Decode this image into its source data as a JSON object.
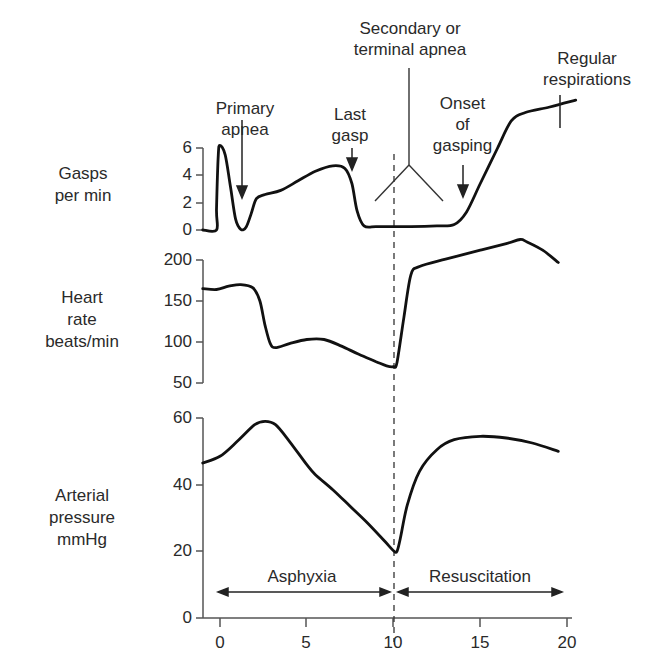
{
  "chart_data": [
    {
      "type": "line",
      "panel": "gasps",
      "ylabel": "Gasps per min",
      "ylabel_lines": [
        "Gasps",
        "per min"
      ],
      "yticks": [
        0,
        2,
        4,
        6
      ],
      "ylim": [
        0,
        6
      ],
      "xlim": [
        -1,
        21
      ],
      "series": [
        {
          "name": "Gasps per min",
          "points": [
            [
              -1,
              0
            ],
            [
              -0.2,
              0
            ],
            [
              -0.2,
              1.5
            ],
            [
              -0.1,
              5.5
            ],
            [
              0,
              6.2
            ],
            [
              0.3,
              5.5
            ],
            [
              0.6,
              3.2
            ],
            [
              0.9,
              0.8
            ],
            [
              1.2,
              0.05
            ],
            [
              1.5,
              0.2
            ],
            [
              1.8,
              1.2
            ],
            [
              2.1,
              2.3
            ],
            [
              2.6,
              2.6
            ],
            [
              3.5,
              2.9
            ],
            [
              4.5,
              3.6
            ],
            [
              5.5,
              4.3
            ],
            [
              6.5,
              4.7
            ],
            [
              7.2,
              4.5
            ],
            [
              7.6,
              3.4
            ],
            [
              7.9,
              1.4
            ],
            [
              8.3,
              0.3
            ],
            [
              9,
              0.25
            ],
            [
              10,
              0.25
            ],
            [
              11,
              0.25
            ],
            [
              12.5,
              0.3
            ],
            [
              13.5,
              0.4
            ],
            [
              14.2,
              1.3
            ],
            [
              15,
              3.4
            ],
            [
              16,
              6.0
            ],
            [
              16.8,
              8.0
            ],
            [
              17.6,
              8.6
            ],
            [
              19,
              9.0
            ],
            [
              20.5,
              9.5
            ]
          ]
        }
      ],
      "annotations": [
        {
          "text": "Primary apnea",
          "x": 1.2,
          "arrow_to_y": 2.2
        },
        {
          "text": "Last gasp",
          "x": 7.7,
          "arrow_to_y": 6.1
        },
        {
          "text": "Secondary or terminal apnea",
          "x": 11
        },
        {
          "text": "Onset of gasping",
          "x": 14.0,
          "arrow_to_y": 1.8
        },
        {
          "text": "Regular respirations",
          "x": 19.0
        }
      ]
    },
    {
      "type": "line",
      "panel": "heart_rate",
      "ylabel": "Heart rate beats/min",
      "ylabel_lines": [
        "Heart",
        "rate",
        "beats/min"
      ],
      "yticks": [
        50,
        100,
        150,
        200
      ],
      "ylim": [
        50,
        200
      ],
      "xlim": [
        -1,
        21
      ],
      "series": [
        {
          "name": "Heart rate",
          "points": [
            [
              -1,
              165
            ],
            [
              -0.2,
              164
            ],
            [
              0.5,
              168
            ],
            [
              1.2,
              170
            ],
            [
              1.9,
              166
            ],
            [
              2.3,
              150
            ],
            [
              2.6,
              120
            ],
            [
              2.9,
              98
            ],
            [
              3.2,
              93
            ],
            [
              4.0,
              98
            ],
            [
              5.0,
              103
            ],
            [
              6.0,
              103
            ],
            [
              7.0,
              95
            ],
            [
              8.0,
              85
            ],
            [
              9.0,
              76
            ],
            [
              9.6,
              71
            ],
            [
              10,
              70
            ],
            [
              10.2,
              75
            ],
            [
              10.6,
              130
            ],
            [
              11.0,
              182
            ],
            [
              11.5,
              192
            ],
            [
              13,
              201
            ],
            [
              15,
              212
            ],
            [
              16.5,
              220
            ],
            [
              17.3,
              225
            ],
            [
              17.7,
              222
            ],
            [
              18.6,
              212
            ],
            [
              19.5,
              197
            ]
          ]
        }
      ]
    },
    {
      "type": "line",
      "panel": "arterial_pressure",
      "ylabel": "Arterial pressure mmHg",
      "ylabel_lines": [
        "Arterial",
        "pressure",
        "mmHg"
      ],
      "yticks": [
        0,
        20,
        40,
        60
      ],
      "ylim": [
        0,
        60
      ],
      "xlim": [
        -1,
        21
      ],
      "xticks": [
        0,
        5,
        10,
        15,
        20
      ],
      "series": [
        {
          "name": "Arterial pressure",
          "points": [
            [
              -1,
              46.5
            ],
            [
              0,
              48.5
            ],
            [
              1.0,
              53
            ],
            [
              2.0,
              58
            ],
            [
              2.6,
              59
            ],
            [
              3.2,
              58
            ],
            [
              4.0,
              53
            ],
            [
              5.0,
              46
            ],
            [
              5.5,
              43
            ],
            [
              6.5,
              38.5
            ],
            [
              7.5,
              33.5
            ],
            [
              8.5,
              28.5
            ],
            [
              9.5,
              23
            ],
            [
              10,
              20.2
            ],
            [
              10.2,
              20
            ],
            [
              10.4,
              24
            ],
            [
              10.8,
              34
            ],
            [
              11.5,
              44
            ],
            [
              12.5,
              50.5
            ],
            [
              13.5,
              53.5
            ],
            [
              15,
              54.5
            ],
            [
              16.5,
              54
            ],
            [
              18,
              52.5
            ],
            [
              19.5,
              50
            ]
          ]
        }
      ],
      "annotations": [
        {
          "text": "Asphyxia",
          "from": -0.1,
          "to": 9.7
        },
        {
          "text": "Resuscitation",
          "from": 10.4,
          "to": 19.5
        }
      ]
    }
  ],
  "labels": {
    "gasps": [
      "Gasps",
      "per min"
    ],
    "heart_rate": [
      "Heart",
      "rate",
      "beats/min"
    ],
    "pressure": [
      "Arterial",
      "pressure",
      "mmHg"
    ],
    "primary_apnea": [
      "Primary",
      "apnea"
    ],
    "last_gasp": [
      "Last",
      "gasp"
    ],
    "secondary_apnea": [
      "Secondary or",
      "terminal apnea"
    ],
    "onset_gasping": [
      "Onset",
      "of",
      "gasping"
    ],
    "regular_resp": [
      "Regular",
      "respirations"
    ],
    "asphyxia": "Asphyxia",
    "resuscitation": "Resuscitation"
  },
  "ticks": {
    "gasps": [
      "6",
      "4",
      "2",
      "0"
    ],
    "heart": [
      "200",
      "150",
      "100",
      "50"
    ],
    "pressure": [
      "60",
      "40",
      "20",
      "0"
    ],
    "x": [
      "0",
      "5",
      "10",
      "15",
      "20"
    ]
  },
  "colors": {
    "line": "#111111",
    "axis": "#555555",
    "text": "#2a2a2a"
  }
}
